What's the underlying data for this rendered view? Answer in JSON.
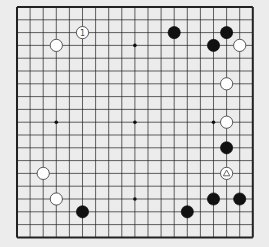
{
  "board": {
    "size": 19,
    "origin": {
      "x": 17,
      "y": 7
    },
    "spacing": {
      "x": 13.1,
      "y": 12.8
    },
    "line_color": "#222222",
    "background": "#ececec",
    "star_points": [
      [
        3,
        3
      ],
      [
        9,
        3
      ],
      [
        15,
        3
      ],
      [
        3,
        9
      ],
      [
        9,
        9
      ],
      [
        15,
        9
      ],
      [
        3,
        15
      ],
      [
        9,
        15
      ],
      [
        15,
        15
      ]
    ]
  },
  "stones": [
    {
      "color": "white",
      "col": 5,
      "row": 2,
      "label": "1"
    },
    {
      "color": "white",
      "col": 3,
      "row": 3,
      "label": ""
    },
    {
      "color": "black",
      "col": 12,
      "row": 2,
      "label": ""
    },
    {
      "color": "black",
      "col": 16,
      "row": 2,
      "label": ""
    },
    {
      "color": "black",
      "col": 15,
      "row": 3,
      "label": ""
    },
    {
      "color": "white",
      "col": 17,
      "row": 3,
      "label": ""
    },
    {
      "color": "white",
      "col": 16,
      "row": 6,
      "label": ""
    },
    {
      "color": "white",
      "col": 16,
      "row": 9,
      "label": ""
    },
    {
      "color": "black",
      "col": 16,
      "row": 11,
      "label": ""
    },
    {
      "color": "white",
      "col": 16,
      "row": 13,
      "label": "triangle"
    },
    {
      "color": "black",
      "col": 15,
      "row": 15,
      "label": ""
    },
    {
      "color": "black",
      "col": 17,
      "row": 15,
      "label": ""
    },
    {
      "color": "black",
      "col": 13,
      "row": 16,
      "label": ""
    },
    {
      "color": "white",
      "col": 2,
      "row": 13,
      "label": ""
    },
    {
      "color": "white",
      "col": 3,
      "row": 15,
      "label": ""
    },
    {
      "color": "black",
      "col": 5,
      "row": 16,
      "label": ""
    }
  ]
}
